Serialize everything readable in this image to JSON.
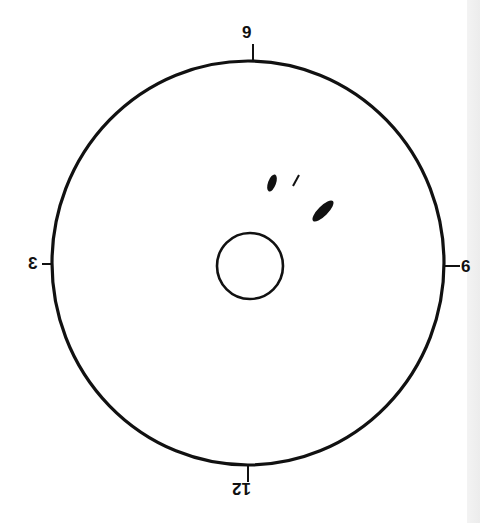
{
  "diagram": {
    "type": "clock-position dial (inverted orientation)",
    "labels": {
      "top": "9",
      "bottom": "12",
      "left": "3",
      "right": "6"
    },
    "outer_circle": {
      "cx": 248,
      "cy": 263,
      "rx": 196,
      "ry": 202,
      "stroke": "#111111"
    },
    "center_hole": {
      "cx": 250,
      "cy": 266,
      "r": 33,
      "stroke": "#111111"
    },
    "marks": [
      {
        "name": "small-ellipse-mark",
        "cx": 272,
        "cy": 183,
        "rx": 4,
        "ry": 9,
        "rotate": 20
      },
      {
        "name": "dash-mark",
        "x1": 293,
        "y1": 186,
        "x2": 299,
        "y2": 175
      },
      {
        "name": "large-ellipse-mark",
        "cx": 323,
        "cy": 211,
        "rx": 5,
        "ry": 14,
        "rotate": 45
      }
    ],
    "colors": {
      "ink": "#111111",
      "background": "#ffffff",
      "edge_strip": "#efefef"
    }
  }
}
